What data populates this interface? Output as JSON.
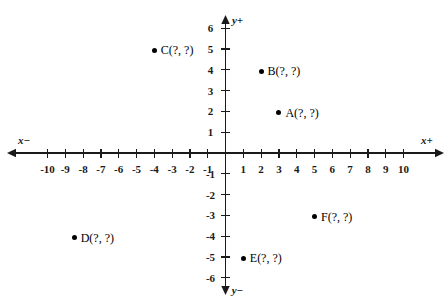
{
  "chart_data": {
    "type": "scatter",
    "title": "",
    "xlabel": "x",
    "ylabel": "y",
    "grid": false,
    "legend": "none",
    "xlim": [
      -11,
      11
    ],
    "ylim": [
      -7,
      7
    ],
    "x_axis": {
      "positive_label": "x+",
      "negative_label": "x−",
      "tick_labels": [
        "-10",
        "-9",
        "-8",
        "-7",
        "-6",
        "-5",
        "-4",
        "-3",
        "-2",
        "-1",
        "1",
        "2",
        "3",
        "4",
        "5",
        "6",
        "7",
        "8",
        "9",
        "10"
      ],
      "tick_values": [
        -10,
        -9,
        -8,
        -7,
        -6,
        -5,
        -4,
        -3,
        -2,
        -1,
        1,
        2,
        3,
        4,
        5,
        6,
        7,
        8,
        9,
        10
      ]
    },
    "y_axis": {
      "positive_label": "y+",
      "negative_label": "y−",
      "tick_labels": [
        "6",
        "5",
        "4",
        "3",
        "2",
        "1",
        "-1",
        "-2",
        "-3",
        "-4",
        "-5",
        "-6"
      ],
      "tick_values": [
        6,
        5,
        4,
        3,
        2,
        1,
        -1,
        -2,
        -3,
        -4,
        -5,
        -6
      ]
    },
    "points": [
      {
        "name": "C",
        "label": "C(?, ?)",
        "x": -4,
        "y": 5
      },
      {
        "name": "B",
        "label": "B(?, ?)",
        "x": 2,
        "y": 4
      },
      {
        "name": "A",
        "label": "A(?, ?)",
        "x": 3,
        "y": 2
      },
      {
        "name": "F",
        "label": "F(?, ?)",
        "x": 5,
        "y": -3
      },
      {
        "name": "D",
        "label": "D(?, ?)",
        "x": -8.5,
        "y": -4
      },
      {
        "name": "E",
        "label": "E(?, ?)",
        "x": 1,
        "y": -5
      }
    ],
    "colors": {
      "axis": "#1a1a1a",
      "point": "#000000",
      "background": "#ffffff"
    }
  }
}
